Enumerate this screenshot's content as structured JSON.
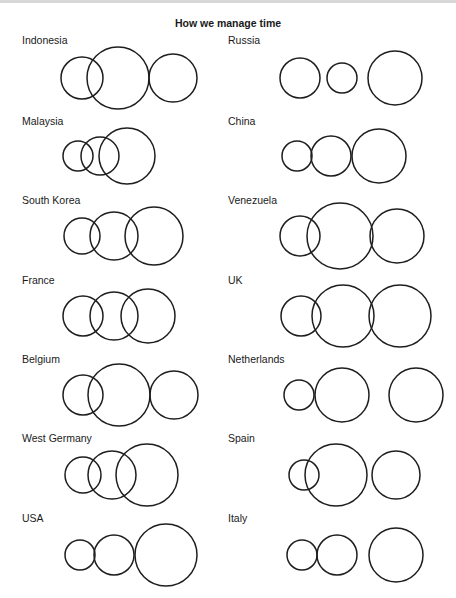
{
  "title": "How we manage time",
  "panels": [
    {
      "country": "Indonesia",
      "label_pos": [
        22,
        34
      ],
      "circles": [
        {
          "cx": 82,
          "cy": 78,
          "r": 21
        },
        {
          "cx": 118,
          "cy": 78,
          "r": 31
        },
        {
          "cx": 173,
          "cy": 78,
          "r": 24
        }
      ]
    },
    {
      "country": "Russia",
      "label_pos": [
        228,
        34
      ],
      "circles": [
        {
          "cx": 300,
          "cy": 78,
          "r": 20
        },
        {
          "cx": 342,
          "cy": 78,
          "r": 15
        },
        {
          "cx": 395,
          "cy": 78,
          "r": 27
        }
      ]
    },
    {
      "country": "Malaysia",
      "label_pos": [
        22,
        115
      ],
      "circles": [
        {
          "cx": 78,
          "cy": 156,
          "r": 15
        },
        {
          "cx": 100,
          "cy": 156,
          "r": 19
        },
        {
          "cx": 127,
          "cy": 156,
          "r": 28
        }
      ]
    },
    {
      "country": "China",
      "label_pos": [
        228,
        115
      ],
      "circles": [
        {
          "cx": 297,
          "cy": 156,
          "r": 15
        },
        {
          "cx": 331,
          "cy": 156,
          "r": 20
        },
        {
          "cx": 379,
          "cy": 156,
          "r": 27
        }
      ]
    },
    {
      "country": "South Korea",
      "label_pos": [
        22,
        194
      ],
      "circles": [
        {
          "cx": 82,
          "cy": 236,
          "r": 18
        },
        {
          "cx": 114,
          "cy": 236,
          "r": 24
        },
        {
          "cx": 154,
          "cy": 236,
          "r": 29
        }
      ]
    },
    {
      "country": "Venezuela",
      "label_pos": [
        228,
        194
      ],
      "circles": [
        {
          "cx": 300,
          "cy": 236,
          "r": 20
        },
        {
          "cx": 340,
          "cy": 236,
          "r": 33
        },
        {
          "cx": 397,
          "cy": 236,
          "r": 27
        }
      ]
    },
    {
      "country": "France",
      "label_pos": [
        22,
        274
      ],
      "circles": [
        {
          "cx": 83,
          "cy": 316,
          "r": 20
        },
        {
          "cx": 114,
          "cy": 316,
          "r": 24
        },
        {
          "cx": 148,
          "cy": 316,
          "r": 27
        }
      ]
    },
    {
      "country": "UK",
      "label_pos": [
        228,
        274
      ],
      "circles": [
        {
          "cx": 301,
          "cy": 316,
          "r": 20
        },
        {
          "cx": 343,
          "cy": 316,
          "r": 31
        },
        {
          "cx": 400,
          "cy": 316,
          "r": 31
        }
      ]
    },
    {
      "country": "Belgium",
      "label_pos": [
        22,
        353
      ],
      "circles": [
        {
          "cx": 83,
          "cy": 395,
          "r": 20
        },
        {
          "cx": 119,
          "cy": 395,
          "r": 31
        },
        {
          "cx": 174,
          "cy": 395,
          "r": 24
        }
      ]
    },
    {
      "country": "Netherlands",
      "label_pos": [
        228,
        353
      ],
      "circles": [
        {
          "cx": 299,
          "cy": 395,
          "r": 15
        },
        {
          "cx": 342,
          "cy": 395,
          "r": 27
        },
        {
          "cx": 416,
          "cy": 395,
          "r": 27
        }
      ]
    },
    {
      "country": "West Germany",
      "label_pos": [
        22,
        432
      ],
      "circles": [
        {
          "cx": 83,
          "cy": 475,
          "r": 18
        },
        {
          "cx": 112,
          "cy": 475,
          "r": 24
        },
        {
          "cx": 147,
          "cy": 475,
          "r": 31
        }
      ]
    },
    {
      "country": "Spain",
      "label_pos": [
        228,
        432
      ],
      "circles": [
        {
          "cx": 304,
          "cy": 475,
          "r": 15
        },
        {
          "cx": 336,
          "cy": 475,
          "r": 31
        },
        {
          "cx": 396,
          "cy": 475,
          "r": 24
        }
      ]
    },
    {
      "country": "USA",
      "label_pos": [
        22,
        512
      ],
      "circles": [
        {
          "cx": 80,
          "cy": 555,
          "r": 15
        },
        {
          "cx": 114,
          "cy": 555,
          "r": 20
        },
        {
          "cx": 166,
          "cy": 555,
          "r": 31
        }
      ]
    },
    {
      "country": "Italy",
      "label_pos": [
        228,
        512
      ],
      "circles": [
        {
          "cx": 302,
          "cy": 555,
          "r": 15
        },
        {
          "cx": 337,
          "cy": 555,
          "r": 20
        },
        {
          "cx": 396,
          "cy": 555,
          "r": 27
        }
      ]
    }
  ]
}
